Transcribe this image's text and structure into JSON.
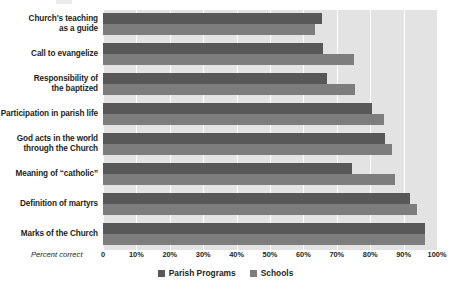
{
  "chart_data": {
    "type": "bar",
    "orientation": "horizontal",
    "title": "",
    "xlabel": "Percent correct",
    "ylabel": "",
    "xlim": [
      0,
      100
    ],
    "grid": true,
    "legend_position": "bottom-center",
    "categories": [
      "Church's teaching as a guide",
      "Call to evangelize",
      "Responsibility of the baptized",
      "Participation in parish life",
      "God acts in the world through the Church",
      "Meaning of “catholic”",
      "Definition of martyrs",
      "Marks of the Church"
    ],
    "category_lines": [
      [
        "Church's teaching",
        "as a guide"
      ],
      [
        "Call to evangelize"
      ],
      [
        "Responsibility of",
        "the baptized"
      ],
      [
        "Participation in parish life"
      ],
      [
        "God acts in the world",
        "through the Church"
      ],
      [
        "Meaning of “catholic”"
      ],
      [
        "Definition of martyrs"
      ],
      [
        "Marks of the Church"
      ]
    ],
    "series": [
      {
        "name": "Parish Programs",
        "color": "#585858",
        "values": [
          65.5,
          66.0,
          67.0,
          80.5,
          84.5,
          74.5,
          92.0,
          96.5
        ]
      },
      {
        "name": "Schools",
        "color": "#7d7d7d",
        "values": [
          63.5,
          75.0,
          75.5,
          84.0,
          86.5,
          87.5,
          94.0,
          96.5
        ]
      }
    ],
    "xticks": [
      0,
      10,
      20,
      30,
      40,
      50,
      60,
      70,
      80,
      90,
      100
    ],
    "xtick_labels": [
      "0",
      "10%",
      "20%",
      "30%",
      "40%",
      "50%",
      "60%",
      "70%",
      "80%",
      "90%",
      "100%"
    ],
    "plot_background": "#e3e3e3",
    "gridline_color": "#ffffff"
  }
}
